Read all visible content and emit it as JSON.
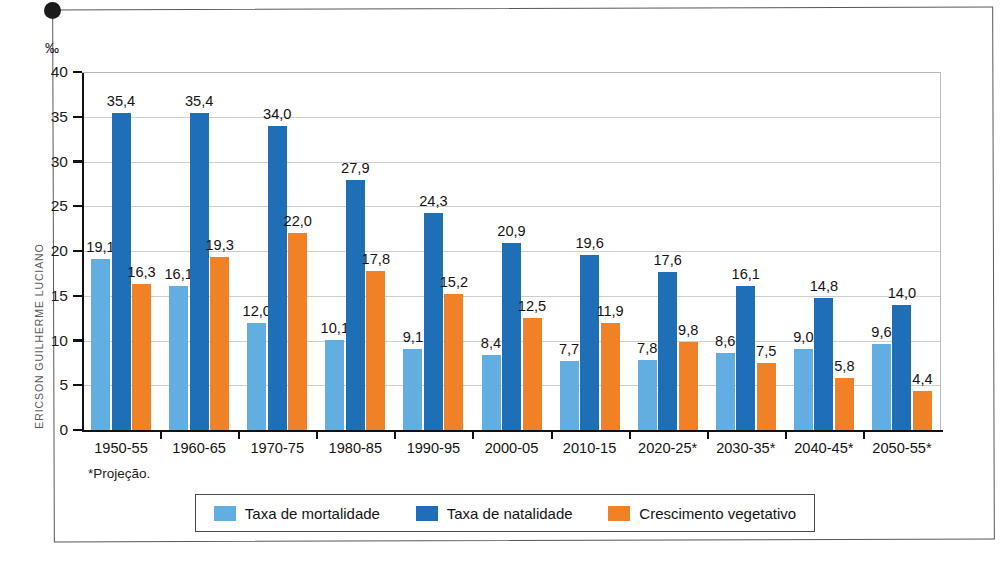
{
  "credit": "ERICSON GUILHERME LUCIANO",
  "footnote": "*Projeção.",
  "unit_symbol": "‰",
  "colors": {
    "mortalidade": "#63AEE0",
    "natalidade": "#1E6FB6",
    "crescimento": "#F08127",
    "axis": "#111111",
    "grid": "#cfcfd1",
    "frame": "#58585a"
  },
  "legend": {
    "items": [
      {
        "label": "Taxa de mortalidade",
        "color_key": "mortalidade"
      },
      {
        "label": "Taxa de natalidade",
        "color_key": "natalidade"
      },
      {
        "label": "Crescimento vegetativo",
        "color_key": "crescimento"
      }
    ]
  },
  "chart_data": {
    "type": "bar",
    "title": "",
    "xlabel": "",
    "ylabel": "‰",
    "ylim": [
      0,
      40
    ],
    "ytick_labels": [
      "0",
      "5",
      "10",
      "15",
      "20",
      "25",
      "30",
      "35",
      "40"
    ],
    "yticks": [
      0,
      5,
      10,
      15,
      20,
      25,
      30,
      35,
      40
    ],
    "grid": true,
    "legend_position": "bottom",
    "categories": [
      "1950-55",
      "1960-65",
      "1970-75",
      "1980-85",
      "1990-95",
      "2000-05",
      "2010-15",
      "2020-25*",
      "2030-35*",
      "2040-45*",
      "2050-55*"
    ],
    "series": [
      {
        "name": "Taxa de mortalidade",
        "color": "#63AEE0",
        "values": [
          19.1,
          16.1,
          12.0,
          10.1,
          9.1,
          8.4,
          7.7,
          7.8,
          8.6,
          9.0,
          9.6
        ],
        "labels": [
          "19,1",
          "16,1",
          "12,0",
          "10,1",
          "9,1",
          "8,4",
          "7,7",
          "7,8",
          "8,6",
          "9,0",
          "9,6"
        ]
      },
      {
        "name": "Taxa de natalidade",
        "color": "#1E6FB6",
        "values": [
          35.4,
          35.4,
          34.0,
          27.9,
          24.3,
          20.9,
          19.6,
          17.6,
          16.1,
          14.8,
          14.0
        ],
        "labels": [
          "35,4",
          "35,4",
          "34,0",
          "27,9",
          "24,3",
          "20,9",
          "19,6",
          "17,6",
          "16,1",
          "14,8",
          "14,0"
        ]
      },
      {
        "name": "Crescimento vegetativo",
        "color": "#F08127",
        "values": [
          16.3,
          19.3,
          22.0,
          17.8,
          15.2,
          12.5,
          11.9,
          9.8,
          7.5,
          5.8,
          4.4
        ],
        "labels": [
          "16,3",
          "19,3",
          "22,0",
          "17,8",
          "15,2",
          "12,5",
          "11,9",
          "9,8",
          "7,5",
          "5,8",
          "4,4"
        ]
      }
    ]
  }
}
